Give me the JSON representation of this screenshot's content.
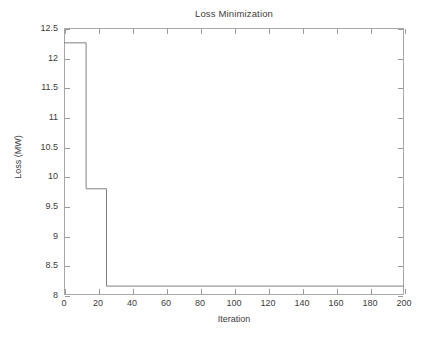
{
  "chart_data": {
    "type": "line",
    "title": "Loss Minimization",
    "xlabel": "Iteration",
    "ylabel": "Loss (MW)",
    "xlim": [
      0,
      200
    ],
    "ylim": [
      8,
      12.5
    ],
    "xticks": [
      0,
      20,
      40,
      60,
      80,
      100,
      120,
      140,
      160,
      180,
      200
    ],
    "yticks": [
      8,
      8.5,
      9,
      9.5,
      10,
      10.5,
      11,
      11.5,
      12,
      12.5
    ],
    "xtick_labels": [
      "0",
      "20",
      "40",
      "60",
      "80",
      "100",
      "120",
      "140",
      "160",
      "180",
      "200"
    ],
    "ytick_labels": [
      "8",
      "8.5",
      "9",
      "9.5",
      "10",
      "10.5",
      "11",
      "11.5",
      "12",
      "12.5"
    ],
    "grid": false,
    "legend": null,
    "line_color": "#808080",
    "series": [
      {
        "name": "Loss",
        "style": "step",
        "x": [
          0,
          13,
          13,
          25,
          25,
          200
        ],
        "y": [
          12.25,
          12.25,
          9.79,
          9.79,
          8.15,
          8.15
        ]
      }
    ],
    "annotations": [
      {
        "label": "initial loss plateau",
        "iteration_range": [
          0,
          13
        ],
        "value": 12.25
      },
      {
        "label": "intermediate plateau",
        "iteration_range": [
          13,
          25
        ],
        "value": 9.79
      },
      {
        "label": "converged minimum",
        "iteration_range": [
          25,
          200
        ],
        "value": 8.15
      }
    ]
  },
  "colors": {
    "axis": "#a8a8a8",
    "tick": "#9a9a9a",
    "text": "#3c3c3c",
    "line": "#808080",
    "background": "#ffffff"
  }
}
